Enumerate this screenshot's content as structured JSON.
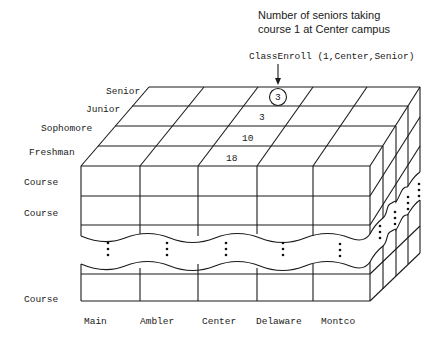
{
  "annotation": {
    "line1": "Number of seniors taking",
    "line2": "course 1 at Center campus",
    "formula": "ClassEnroll (1,Center,Senior)"
  },
  "depth_labels": [
    "Senior",
    "Junior",
    "Sophomore",
    "Freshman"
  ],
  "row_labels": [
    "Course",
    "Course",
    "Course"
  ],
  "column_labels": [
    "Main",
    "Ambler",
    "Center",
    "Delaware",
    "Montco"
  ],
  "cell_values": {
    "senior_center": "3",
    "junior_center": "3",
    "sophomore_center": "10",
    "freshman_center": "18"
  },
  "highlight": {
    "cell": "senior_center",
    "marker": "circle"
  }
}
